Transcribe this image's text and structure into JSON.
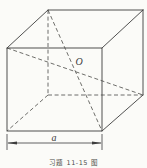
{
  "figure": {
    "type": "geometry-diagram",
    "background_color": "#fbfbf8",
    "line_color": "#3d3d3d",
    "labels": {
      "center_point": "O",
      "edge_length": "a",
      "caption": "习题 11-15 图"
    }
  }
}
